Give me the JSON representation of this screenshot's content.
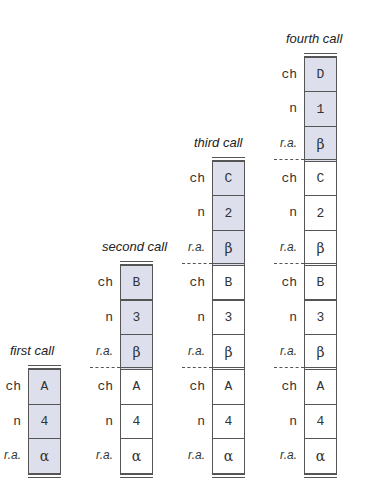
{
  "diagram": {
    "row_labels": [
      "ch",
      "n",
      "r.a."
    ],
    "active_color": "#dde0ec",
    "calls": [
      {
        "title": "first call",
        "frames": [
          {
            "ch": "A",
            "n": "4",
            "ra": "α",
            "active": true
          }
        ]
      },
      {
        "title": "second call",
        "frames": [
          {
            "ch": "B",
            "n": "3",
            "ra": "β",
            "active": true
          },
          {
            "ch": "A",
            "n": "4",
            "ra": "α",
            "active": false
          }
        ]
      },
      {
        "title": "third call",
        "frames": [
          {
            "ch": "C",
            "n": "2",
            "ra": "β",
            "active": true
          },
          {
            "ch": "B",
            "n": "3",
            "ra": "β",
            "active": false
          },
          {
            "ch": "A",
            "n": "4",
            "ra": "α",
            "active": false
          }
        ]
      },
      {
        "title": "fourth call",
        "frames": [
          {
            "ch": "D",
            "n": "1",
            "ra": "β",
            "active": true
          },
          {
            "ch": "C",
            "n": "2",
            "ra": "β",
            "active": false
          },
          {
            "ch": "B",
            "n": "3",
            "ra": "β",
            "active": false
          },
          {
            "ch": "A",
            "n": "4",
            "ra": "α",
            "active": false
          }
        ]
      }
    ]
  }
}
